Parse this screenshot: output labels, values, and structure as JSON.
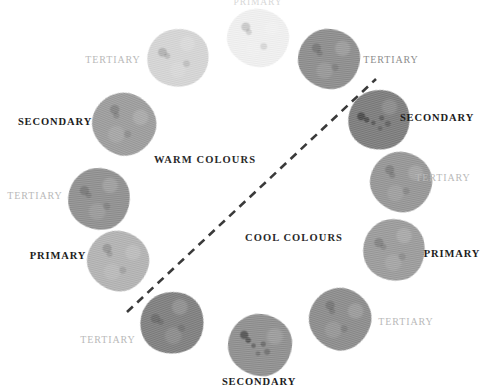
{
  "figure": {
    "type": "colour-wheel-diagram",
    "background": "#ffffff",
    "note_top_cut_label": "PRIMARY"
  },
  "regions": [
    {
      "id": "warm",
      "label": "WARM COLOURS",
      "x": 205,
      "y": 160
    },
    {
      "id": "cool",
      "label": "COOL COLOURS",
      "x": 294,
      "y": 238
    }
  ],
  "divider": {
    "name": "warm-cool-divider",
    "x1": 127,
    "y1": 312,
    "x2": 376,
    "y2": 79,
    "color": "#3a3a3a",
    "dash": "8 6",
    "width": 2.6
  },
  "swatches": [
    {
      "id": "s01",
      "label": "PRIMARY",
      "label_class": "cutoff",
      "label_x": 258,
      "label_y": 3,
      "x": 258,
      "y": 38,
      "w": 62,
      "h": 58,
      "color": "#f1f1f1",
      "speckled": false,
      "rot": 8
    },
    {
      "id": "s02",
      "label": "TERTIARY",
      "label_class": "pale",
      "label_x": 113,
      "label_y": 60,
      "x": 178,
      "y": 58,
      "w": 62,
      "h": 58,
      "color": "#d5d5d5",
      "speckled": false,
      "rot": -14
    },
    {
      "id": "s03",
      "label": "SECONDARY",
      "label_class": "dark",
      "label_x": 55,
      "label_y": 122,
      "x": 124,
      "y": 124,
      "w": 64,
      "h": 62,
      "color": "#9b9b9b",
      "speckled": false,
      "rot": 22
    },
    {
      "id": "s04",
      "label": "TERTIARY",
      "label_class": "pale",
      "label_x": 35,
      "label_y": 196,
      "x": 99,
      "y": 199,
      "w": 62,
      "h": 62,
      "color": "#8e8e8e",
      "speckled": false,
      "rot": -6
    },
    {
      "id": "s05",
      "label": "PRIMARY",
      "label_class": "dark",
      "label_x": 58,
      "label_y": 256,
      "x": 118,
      "y": 261,
      "w": 62,
      "h": 60,
      "color": "#b2b2b2",
      "speckled": false,
      "rot": 14
    },
    {
      "id": "s06",
      "label": "TERTIARY",
      "label_class": "pale",
      "label_x": 108,
      "label_y": 340,
      "x": 172,
      "y": 323,
      "w": 64,
      "h": 62,
      "color": "#7d7d7d",
      "speckled": false,
      "rot": -20
    },
    {
      "id": "s07",
      "label": "SECONDARY",
      "label_class": "dark",
      "label_x": 259,
      "label_y": 382,
      "x": 260,
      "y": 345,
      "w": 64,
      "h": 62,
      "color": "#8d8d8d",
      "speckled": true,
      "rot": 5
    },
    {
      "id": "s08",
      "label": "TERTIARY",
      "label_class": "pale",
      "label_x": 406,
      "label_y": 322,
      "x": 340,
      "y": 319,
      "w": 62,
      "h": 62,
      "color": "#8a8a8a",
      "speckled": false,
      "rot": 18
    },
    {
      "id": "s09",
      "label": "PRIMARY",
      "label_class": "dark",
      "label_x": 452,
      "label_y": 254,
      "x": 394,
      "y": 250,
      "w": 62,
      "h": 62,
      "color": "#9a9a9a",
      "speckled": false,
      "rot": -10
    },
    {
      "id": "s10",
      "label": "TERTIARY",
      "label_class": "pale",
      "label_x": 443,
      "label_y": 178,
      "x": 401,
      "y": 182,
      "w": 62,
      "h": 60,
      "color": "#949494",
      "speckled": false,
      "rot": 12
    },
    {
      "id": "s11",
      "label": "SECONDARY",
      "label_class": "dark",
      "label_x": 437,
      "label_y": 118,
      "x": 379,
      "y": 120,
      "w": 62,
      "h": 60,
      "color": "#7a7a7a",
      "speckled": true,
      "rot": -16
    },
    {
      "id": "s12",
      "label": "TERTIARY",
      "label_class": "mid",
      "label_x": 391,
      "label_y": 60,
      "x": 329,
      "y": 59,
      "w": 62,
      "h": 60,
      "color": "#8b8b8b",
      "speckled": false,
      "rot": 6
    }
  ]
}
